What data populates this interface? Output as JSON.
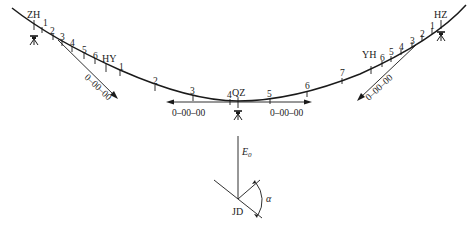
{
  "diagram": {
    "type": "curve stakeout layout (spiral-circular-spiral)",
    "points": {
      "start": "ZH",
      "left_transition_end": "HY",
      "mid": "QZ",
      "right_transition_start": "YH",
      "end": "HZ",
      "intersection": "JD"
    },
    "left_spiral_ticks": [
      "1",
      "2",
      "3",
      "4",
      "5",
      "6"
    ],
    "circular_ticks": [
      "1",
      "2",
      "3",
      "4",
      "5",
      "6",
      "7"
    ],
    "right_spiral_ticks": [
      "1",
      "2",
      "3",
      "4",
      "5",
      "6"
    ],
    "orientation_labels": {
      "zh_direction": "0–00–00",
      "qz_left": "0–00–00",
      "qz_right": "0–00–00",
      "hz_direction": "0–00–00"
    },
    "angle_diagram": {
      "azimuth_label": "E",
      "azimuth_subscript": "0",
      "angle_label": "α",
      "vertex_label": "JD"
    },
    "instrument_icon": "theodolite-icon"
  }
}
